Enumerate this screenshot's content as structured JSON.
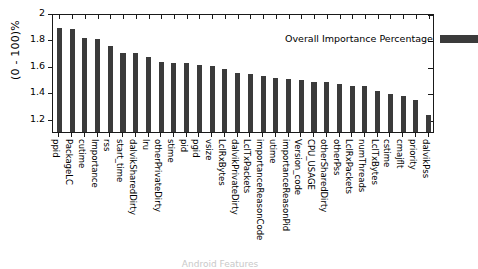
{
  "chart_data": {
    "type": "bar",
    "title": "",
    "xlabel": "Android Features",
    "ylabel": "(0 - 100)%",
    "legend": {
      "position": "top-right",
      "entries": [
        "Overall Importance Percentage"
      ]
    },
    "grid": false,
    "ylim": [
      1.1,
      2.0
    ],
    "yticks": [
      "2",
      "1.8",
      "1.6",
      "1.4",
      "1.2"
    ],
    "ytick_values": [
      2,
      1.8,
      1.6,
      1.4,
      1.2
    ],
    "categories": [
      "ppid",
      "PackageLC",
      "cutime",
      "Importance",
      "rss",
      "start_time",
      "dalvikSharedDirty",
      "lru",
      "otherPrivateDirty",
      "stime",
      "pid",
      "pgid",
      "vsize",
      "LclRxBytes",
      "dalvikPrivateDirty",
      "LclTxPackets",
      "importanceReasonCode",
      "utime",
      "importanceReasonPid",
      "Version_code",
      "CPU_USAGE",
      "otherSharedDirty",
      "otherPss",
      "LclRxPackets",
      "numThreads",
      "LclTxBytes",
      "cstime",
      "cmajflt",
      "priority",
      "dalvikPss"
    ],
    "values": [
      1.89,
      1.88,
      1.81,
      1.8,
      1.75,
      1.7,
      1.7,
      1.67,
      1.63,
      1.62,
      1.62,
      1.61,
      1.6,
      1.58,
      1.55,
      1.54,
      1.52,
      1.51,
      1.5,
      1.49,
      1.48,
      1.48,
      1.46,
      1.45,
      1.45,
      1.41,
      1.39,
      1.37,
      1.34,
      1.23
    ]
  },
  "legend": {
    "label": "Overall Importance Percentage"
  },
  "axes": {
    "y_title": "(0 - 100)%",
    "x_title": "Android Features"
  }
}
